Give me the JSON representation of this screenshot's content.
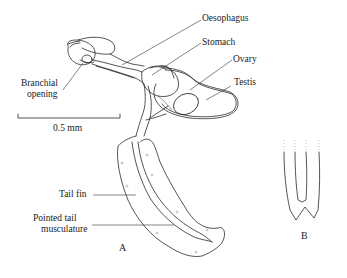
{
  "figure": {
    "panels": [
      {
        "id": "A",
        "label": "A"
      },
      {
        "id": "B",
        "label": "B"
      }
    ],
    "labels": {
      "oesophagus": "Oesophagus",
      "stomach": "Stomach",
      "ovary": "Ovary",
      "testis": "Testis",
      "branchial_line1": "Branchial",
      "branchial_line2": "opening",
      "tail_fin": "Tail fin",
      "pointed_line1": "Pointed tail",
      "pointed_line2": "musculature"
    },
    "scale_bar": {
      "label": "0.5 mm"
    },
    "colors": {
      "line": "#2a2a2a",
      "background": "#ffffff",
      "text": "#1a1a1a"
    }
  }
}
